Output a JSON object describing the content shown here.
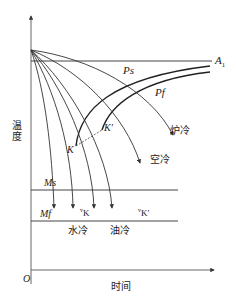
{
  "diagram": {
    "type": "CCT cooling curves superimposed on isothermal transformation diagram",
    "axes": {
      "y_label": "温度",
      "x_label": "时间",
      "origin_label": "O"
    },
    "lines": {
      "a1": "A",
      "a1_sub": "1",
      "ms": "Ms",
      "mf": "Mf"
    },
    "curves": {
      "ps": "Ps",
      "pf": "Pf",
      "k": "K",
      "k_prime": "K′"
    },
    "cooling_labels": {
      "furnace": "炉冷",
      "air": "空冷",
      "water": "水冷",
      "oil": "油冷",
      "vk": "K",
      "vk_prefix": "v",
      "vk_prime": "K′",
      "vk_prime_prefix": "v"
    },
    "colors": {
      "line": "#333333",
      "text": "#222222",
      "background": "#ffffff"
    }
  }
}
